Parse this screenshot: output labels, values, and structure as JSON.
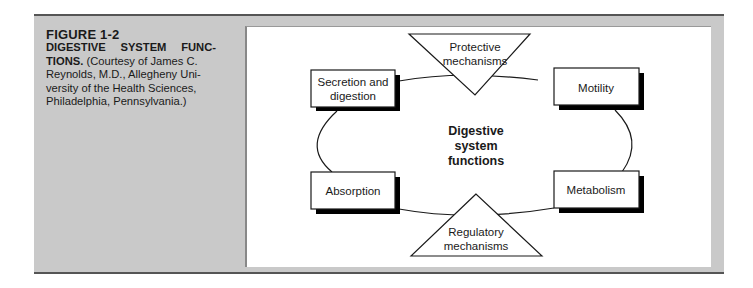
{
  "figure": {
    "number": "FIGURE 1-2",
    "title_line1": "DIGESTIVE SYSTEM FUNC-",
    "title_line2_bold": "TIONS.",
    "caption_line2_rest": " (Courtesy of James C.",
    "caption_line3": "Reynolds, M.D., Allegheny Uni-",
    "caption_line4": "versity of the Health Sciences,",
    "caption_line5": "Philadelphia,  Pennsylvania.)"
  },
  "diagram": {
    "center": {
      "line1": "Digestive",
      "line2": "system",
      "line3": "functions"
    },
    "boxes": {
      "secretion_line1": "Secretion and",
      "secretion_line2": "digestion",
      "motility": "Motility",
      "absorption": "Absorption",
      "metabolism": "Metabolism"
    },
    "triangles": {
      "protective_line1": "Protective",
      "protective_line2": "mechanisms",
      "regulatory_line1": "Regulatory",
      "regulatory_line2": "mechanisms"
    },
    "colors": {
      "panel": "#c9c9c9",
      "inner": "#ffffff",
      "stroke": "#1a1a1a",
      "shadow": "#000000"
    }
  }
}
